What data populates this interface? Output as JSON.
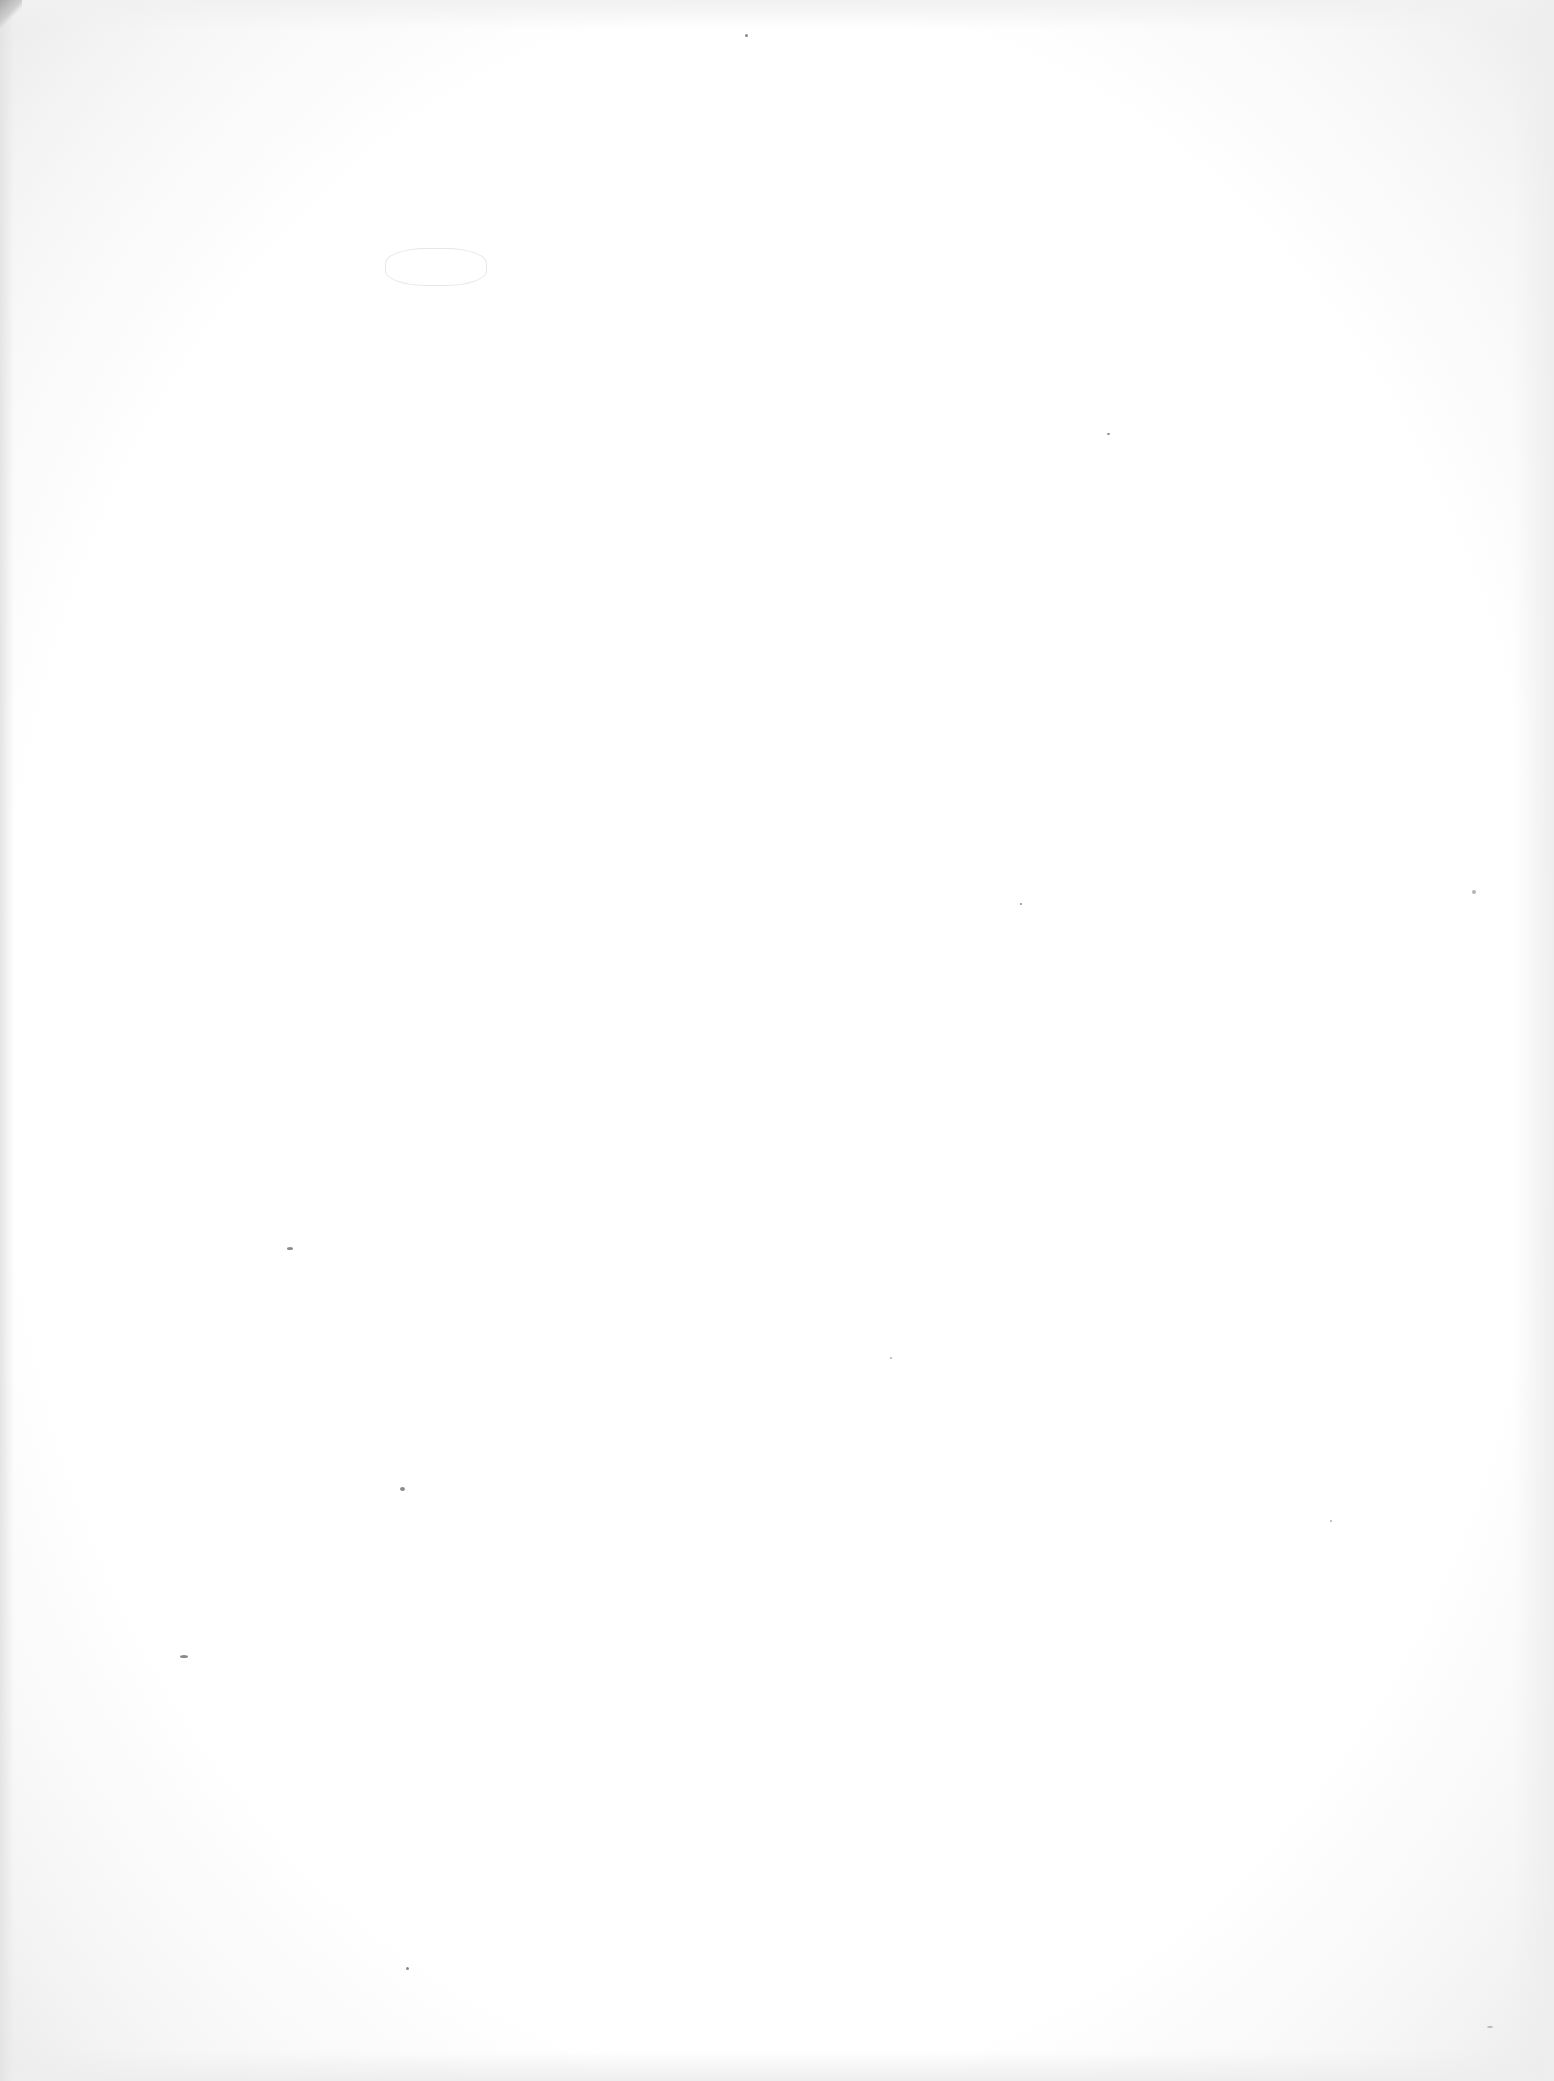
{
  "document": {
    "type": "scanned page",
    "state": "blank",
    "text": "",
    "colors": {
      "paper": "#ffffff",
      "edge_shadow": "#e4e4e4",
      "corner_curl": "#a9a9a9",
      "speck": "#8a8a8a"
    }
  }
}
